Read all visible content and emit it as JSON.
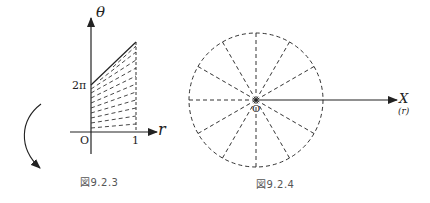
{
  "figure_left": {
    "caption": "図9.2.3",
    "y_axis_label": "θ",
    "x_axis_label": "r",
    "y_tick": "2π",
    "x_tick": "1",
    "origin_label": "O"
  },
  "figure_right": {
    "caption": "図9.2.4",
    "axis_label": "X",
    "axis_sublabel": "(r)",
    "origin_label": "O",
    "spoke_count": 12
  },
  "colors": {
    "line": "#222222",
    "dash": "#333333",
    "caption": "#555555"
  }
}
